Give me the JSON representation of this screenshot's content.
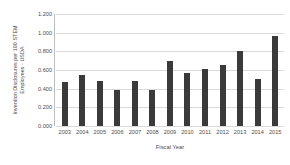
{
  "chart_data": {
    "type": "bar",
    "title": "",
    "xlabel": "Fiscal Year",
    "ylabel": "Invention Disclosures per 100 STEM Employees - USDA",
    "ylabel_lines": [
      "Invention Disclosures per 100 STEM",
      "Employees - USDA"
    ],
    "categories": [
      "2003",
      "2004",
      "2005",
      "2006",
      "2007",
      "2008",
      "2009",
      "2010",
      "2011",
      "2012",
      "2013",
      "2014",
      "2015"
    ],
    "values": [
      0.47,
      0.55,
      0.48,
      0.39,
      0.48,
      0.39,
      0.7,
      0.57,
      0.61,
      0.65,
      0.8,
      0.5,
      0.96
    ],
    "ylim": [
      0.0,
      1.2
    ],
    "ytick_values": [
      0.0,
      0.2,
      0.4,
      0.6,
      0.8,
      1.0,
      1.2
    ],
    "ytick_labels": [
      "0.000",
      "0.200",
      "0.400",
      "0.600",
      "0.800",
      "1.000",
      "1.200"
    ],
    "grid": "horizontal",
    "legend": "none",
    "bar_color": "#3a3a3a",
    "gridline_color": "#d9d9d9",
    "axis_color": "#bfbfbf",
    "background_color": "#ffffff"
  }
}
